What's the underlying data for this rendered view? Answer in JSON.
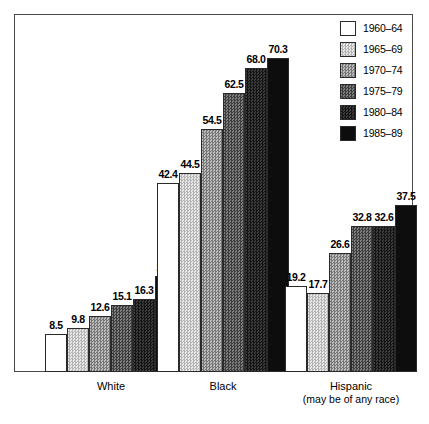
{
  "chart_data": {
    "type": "bar",
    "title": "",
    "subtitle": "",
    "xlabel": "",
    "ylabel": "",
    "ylim": [
      0,
      80
    ],
    "grid": false,
    "legend_position": "top-right",
    "categories": [
      "White",
      "Black",
      "Hispanic"
    ],
    "category_sublabels": [
      "",
      "",
      "(may be of any race)"
    ],
    "series": [
      {
        "name": "1960–64",
        "values": [
          8.5,
          42.4,
          19.2
        ],
        "fill": "white"
      },
      {
        "name": "1965–69",
        "values": [
          9.8,
          44.5,
          17.7
        ],
        "fill": "light-dither"
      },
      {
        "name": "1970–74",
        "values": [
          12.6,
          54.5,
          26.6
        ],
        "fill": "medium-dither"
      },
      {
        "name": "1975–79",
        "values": [
          15.1,
          62.5,
          32.8
        ],
        "fill": "dark-dither"
      },
      {
        "name": "1980–84",
        "values": [
          16.3,
          68.0,
          32.6
        ],
        "fill": "very-dark-dither"
      },
      {
        "name": "1985–89",
        "values": [
          21.6,
          70.3,
          37.5
        ],
        "fill": "black"
      }
    ],
    "value_labels": [
      [
        "8.5",
        "9.8",
        "12.6",
        "15.1",
        "16.3",
        "21.6"
      ],
      [
        "42.4",
        "44.5",
        "54.5",
        "62.5",
        "68.0",
        "70.3"
      ],
      [
        "19.2",
        "17.7",
        "26.6",
        "32.8",
        "32.6",
        "37.5"
      ]
    ],
    "colors": {
      "frame": "#4a4a4a",
      "bar_outline": "#2a2a2a",
      "background": "#ffffff",
      "text": "#000000"
    }
  },
  "legend": {
    "items": [
      {
        "label": "1960–64"
      },
      {
        "label": "1965–69"
      },
      {
        "label": "1970–74"
      },
      {
        "label": "1975–79"
      },
      {
        "label": "1980–84"
      },
      {
        "label": "1985–89"
      }
    ]
  }
}
